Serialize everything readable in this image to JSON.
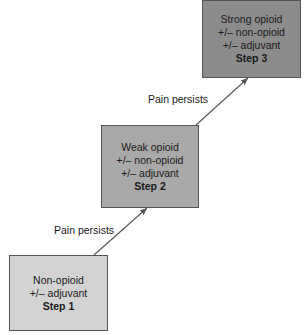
{
  "diagram": {
    "type": "analgesic-ladder",
    "steps": [
      {
        "id": "step1",
        "lines": [
          "Non-opioid",
          "+/– adjuvant"
        ],
        "step_label": "Step 1",
        "fill": "#d3d3d3"
      },
      {
        "id": "step2",
        "lines": [
          "Weak opioid",
          "+/– non-opioid",
          "+/– adjuvant"
        ],
        "step_label": "Step 2",
        "fill": "#a9a9a9"
      },
      {
        "id": "step3",
        "lines": [
          "Strong opioid",
          "+/– non-opioid",
          "+/– adjuvant"
        ],
        "step_label": "Step 3",
        "fill": "#8c8c8c"
      }
    ],
    "transitions": [
      {
        "from": "step1",
        "to": "step2",
        "label": "Pain persists"
      },
      {
        "from": "step2",
        "to": "step3",
        "label": "Pain persists"
      }
    ],
    "colors": {
      "border": "#555555",
      "arrow": "#555555",
      "text": "#1a1a1a"
    }
  }
}
